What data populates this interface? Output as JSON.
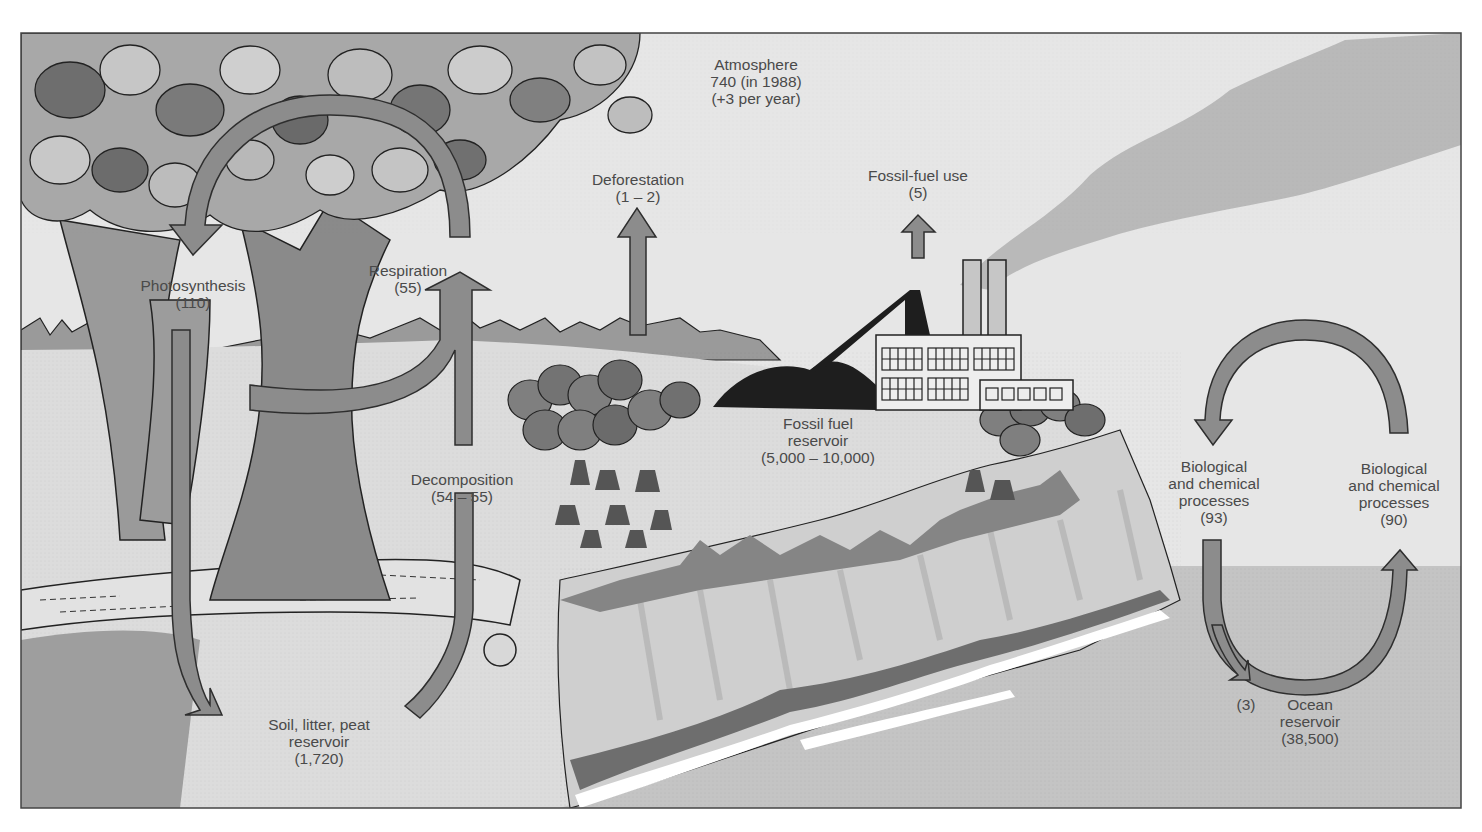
{
  "diagram": {
    "units_note": "",
    "colors": {
      "sky": "#e6e6e6",
      "ocean": "#c4c4c4",
      "arrow_fill": "#8c8c8c",
      "arrow_stroke": "#2e2e2e",
      "cliff": "#d4d4d4",
      "ground": "#dcdcdc",
      "smoke": "#b9b9b9",
      "fossil_fuel": "#1e1e1e",
      "label_text": "#4a4a4a",
      "frame": "#444444"
    },
    "labels": {
      "atmosphere": {
        "name": "Atmosphere",
        "value": "740 (in 1988)",
        "change": "(+3 per year)"
      },
      "deforestation": {
        "name": "Deforestation",
        "value": "(1 – 2)"
      },
      "fossil_fuel_use": {
        "name": "Fossil-fuel use",
        "value": "(5)"
      },
      "photosynthesis": {
        "name": "Photosynthesis",
        "value": "(110)"
      },
      "respiration": {
        "name": "Respiration",
        "value": "(55)"
      },
      "decomposition": {
        "name": "Decomposition",
        "value": "(54 – 55)"
      },
      "fossil_fuel_reservoir": {
        "line1": "Fossil fuel",
        "line2": "reservoir",
        "value": "(5,000 – 10,000)"
      },
      "soil_reservoir": {
        "line1": "Soil, litter, peat",
        "line2": "reservoir",
        "value": "(1,720)"
      },
      "bio_chem_left": {
        "line1": "Biological",
        "line2": "and chemical",
        "line3": "processes",
        "value": "(93)"
      },
      "bio_chem_right": {
        "line1": "Biological",
        "line2": "and chemical",
        "line3": "processes",
        "value": "(90)"
      },
      "ocean_sink": {
        "value": "(3)"
      },
      "ocean_reservoir": {
        "line1": "Ocean",
        "line2": "reservoir",
        "value": "(38,500)"
      }
    },
    "flows": [
      {
        "name": "Photosynthesis",
        "from": "Atmosphere",
        "to": "Soil, litter, peat reservoir",
        "value": "110"
      },
      {
        "name": "Respiration",
        "from": "Vegetation",
        "to": "Atmosphere",
        "value": "55"
      },
      {
        "name": "Decomposition",
        "from": "Soil, litter, peat reservoir",
        "to": "Atmosphere",
        "value": "54 – 55"
      },
      {
        "name": "Deforestation",
        "from": "Land",
        "to": "Atmosphere",
        "value": "1 – 2"
      },
      {
        "name": "Fossil-fuel use",
        "from": "Fossil fuel reservoir",
        "to": "Atmosphere",
        "value": "5"
      },
      {
        "name": "Biological and chemical processes",
        "from": "Atmosphere",
        "to": "Ocean",
        "value": "93"
      },
      {
        "name": "Biological and chemical processes",
        "from": "Ocean",
        "to": "Atmosphere",
        "value": "90"
      },
      {
        "name": "Ocean sink",
        "from": "Ocean surface",
        "to": "Ocean reservoir",
        "value": "3"
      }
    ]
  }
}
